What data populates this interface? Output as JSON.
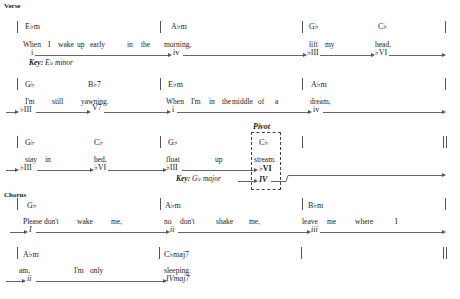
{
  "verse": {
    "label": "Verse",
    "rows": [
      {
        "chords": [
          "E♭m",
          "A♭m",
          "G♭",
          "C♭"
        ],
        "lyrics": [
          "When",
          "I",
          "wake",
          "up",
          "early",
          "in",
          "the",
          "morning,",
          "lift",
          "my",
          "head,"
        ],
        "numerals": [
          "i",
          "iv",
          "♭III",
          "♭VI"
        ],
        "key": {
          "prefix": "Key:",
          "value": "E♭ minor"
        }
      },
      {
        "chords": [
          "G♭",
          "B♭7",
          "E♭m",
          "A♭m"
        ],
        "lyrics": [
          "I'm",
          "still",
          "yawning.",
          "When",
          "I'm",
          "in",
          "the",
          "middle",
          "of",
          "a",
          "dream,"
        ],
        "numerals": [
          "♭III",
          "V7",
          "i",
          "iv"
        ]
      },
      {
        "chords": [
          "G♭",
          "C♭",
          "G♭",
          "C♭"
        ],
        "lyrics": [
          "stay",
          "in",
          "bed,",
          "float",
          "up",
          "stream."
        ],
        "numerals": [
          "♭III",
          "♭VI",
          "♭III",
          "♭VI",
          "IV"
        ],
        "key": {
          "prefix": "Key:",
          "value": "G♭ major"
        },
        "pivot": {
          "label": "Pivot"
        }
      }
    ]
  },
  "chorus": {
    "label": "Chorus",
    "rows": [
      {
        "chords": [
          "G♭",
          "A♭m",
          "B♭m"
        ],
        "lyrics": [
          "Please",
          "don't",
          "wake",
          "me,",
          "no",
          "don't",
          "shake",
          "me,",
          "leave",
          "me",
          "where",
          "I"
        ],
        "numerals": [
          "I",
          "ii",
          "iii"
        ]
      },
      {
        "chords": [
          "A♭m",
          "C♭maj7"
        ],
        "lyrics": [
          "am,",
          "I'm",
          "only",
          "sleeping."
        ],
        "numerals": [
          "ii",
          "IVmaj7"
        ]
      }
    ]
  }
}
